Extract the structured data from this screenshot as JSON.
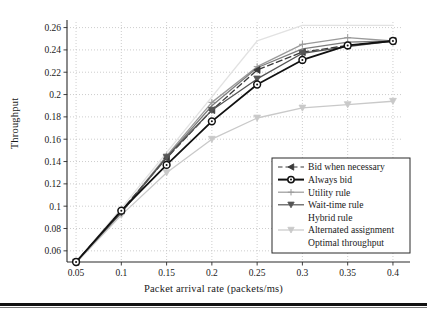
{
  "chart_data": {
    "type": "line",
    "title": "",
    "xlabel": "Packet arrival rate (packets/ms)",
    "ylabel": "Throughput",
    "x": [
      0.05,
      0.1,
      0.15,
      0.2,
      0.25,
      0.3,
      0.35,
      0.4
    ],
    "xticks": [
      "0.05",
      "0.1",
      "0.15",
      "0.2",
      "0.25",
      "0.3",
      "0.35",
      "0.4"
    ],
    "yticks": [
      "0.06",
      "0.08",
      "0.1",
      "0.12",
      "0.14",
      "0.16",
      "0.18",
      "0.2",
      "0.22",
      "0.24",
      "0.26"
    ],
    "xlim": [
      0.04,
      0.41
    ],
    "ylim": [
      0.05,
      0.265
    ],
    "grid": true,
    "grid_style": "dotted",
    "legend_position": "lower right",
    "series": [
      {
        "name": "Bid when necessary",
        "values": [
          0.05,
          0.096,
          0.143,
          0.186,
          0.222,
          0.238,
          0.244,
          0.248
        ],
        "color": "#3a3a3a",
        "line_style": "dashed",
        "marker": "triangle-left"
      },
      {
        "name": "Always bid",
        "values": [
          0.05,
          0.096,
          0.137,
          0.176,
          0.209,
          0.231,
          0.244,
          0.248
        ],
        "color": "#111111",
        "line_style": "solid",
        "marker": "circle"
      },
      {
        "name": "Utility rule",
        "values": [
          0.05,
          0.095,
          0.145,
          0.193,
          0.225,
          0.245,
          0.251,
          0.248
        ],
        "color": "#9a9a9a",
        "line_style": "solid",
        "marker": "plus"
      },
      {
        "name": "Wait-time rule",
        "values": [
          0.05,
          0.094,
          0.144,
          0.186,
          0.214,
          0.237,
          0.243,
          0.248
        ],
        "color": "#555555",
        "line_style": "solid",
        "marker": "triangle-down"
      },
      {
        "name": "Hybrid rule",
        "values": [
          0.05,
          0.095,
          0.144,
          0.19,
          0.224,
          0.241,
          0.247,
          0.248
        ],
        "color": "#7d7d7d",
        "line_style": "solid",
        "marker": "none"
      },
      {
        "name": "Alternated assignment",
        "values": [
          0.049,
          0.092,
          0.13,
          0.16,
          0.179,
          0.188,
          0.191,
          0.194
        ],
        "color": "#c9c9c9",
        "line_style": "solid",
        "marker": "triangle-down"
      },
      {
        "name": "Optimal throughput",
        "values": [
          0.05,
          0.098,
          0.148,
          0.198,
          0.248,
          0.262,
          0.262,
          0.262
        ],
        "color": "#e2e2e2",
        "line_style": "solid",
        "marker": "none"
      }
    ]
  },
  "axes": {
    "ylabel": "Throughput",
    "xlabel": "Packet arrival rate (packets/ms)"
  },
  "legend": {
    "items": [
      {
        "label": "Bid when necessary"
      },
      {
        "label": "Always bid"
      },
      {
        "label": "Utility rule"
      },
      {
        "label": "Wait-time rule"
      },
      {
        "label": "Hybrid rule"
      },
      {
        "label": "Alternated assignment"
      },
      {
        "label": "Optimal throughput"
      }
    ]
  }
}
